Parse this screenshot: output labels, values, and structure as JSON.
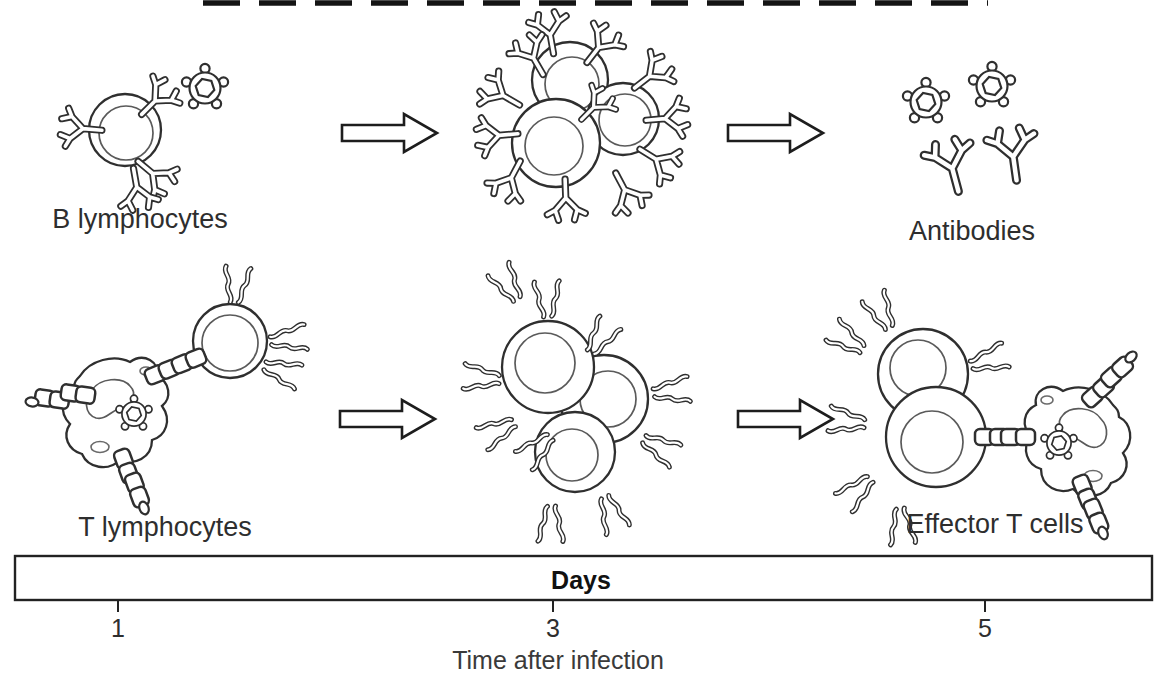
{
  "labels": {
    "b_lymphocytes": "B lymphocytes",
    "antibodies": "Antibodies",
    "t_lymphocytes": "T lymphocytes",
    "effector_t_cells": "Effector T cells"
  },
  "timeline": {
    "title": "Days",
    "tick_labels": [
      "1",
      "3",
      "5"
    ],
    "axis_label": "Time after infection"
  },
  "icons": [
    "b-cell-icon",
    "antibody-icon",
    "antigen-virus-icon",
    "t-cell-icon",
    "antigen-presenting-cell-icon",
    "mhc-chain-link-icon",
    "right-arrow-icon"
  ],
  "colors": {
    "line": "#2f2f2f",
    "text": "#2e2e2e",
    "axis_text": "#3a3a3a",
    "background": "#ffffff"
  }
}
